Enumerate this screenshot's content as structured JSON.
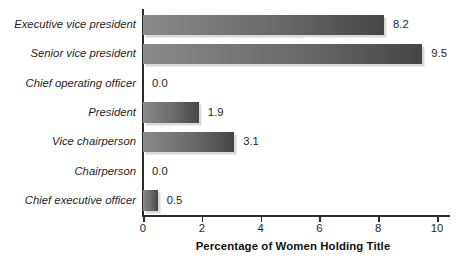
{
  "chart_data": {
    "type": "bar",
    "orientation": "horizontal",
    "title": "",
    "xlabel": "Percentage of Women Holding Title",
    "ylabel": "",
    "categories": [
      "Executive vice president",
      "Senior vice president",
      "Chief operating officer",
      "President",
      "Vice chairperson",
      "Chairperson",
      "Chief executive officer"
    ],
    "values": [
      8.2,
      9.5,
      0.0,
      1.9,
      3.1,
      0.0,
      0.5
    ],
    "value_labels": [
      "8.2",
      "9.5",
      "0.0",
      "1.9",
      "3.1",
      "0.0",
      "0.5"
    ],
    "xlim": [
      0,
      10.5
    ],
    "xticks": [
      0,
      2,
      4,
      6,
      8,
      10
    ],
    "xtick_labels": [
      "0",
      "2",
      "4",
      "6",
      "8",
      "10"
    ],
    "grid": false,
    "legend": null,
    "bar_color_light": "#8a8a8a",
    "bar_color_dark": "#464646",
    "shadow_color": "#d9d9d9",
    "axis_color": "#2b2b2b",
    "background": "#ffffff"
  }
}
